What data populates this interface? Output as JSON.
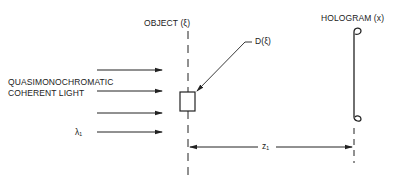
{
  "labels": {
    "object": "OBJECT (ξ)",
    "hologram": "HOLOGRAM (x)",
    "source_line1": "QUASIMONOCHROMATIC",
    "source_line2": "COHERENT LIGHT",
    "wavelength": "λ₁",
    "distribution": "D(ξ)",
    "distance": "z₁"
  },
  "colors": {
    "ink": "#222222",
    "background": "#ffffff"
  }
}
